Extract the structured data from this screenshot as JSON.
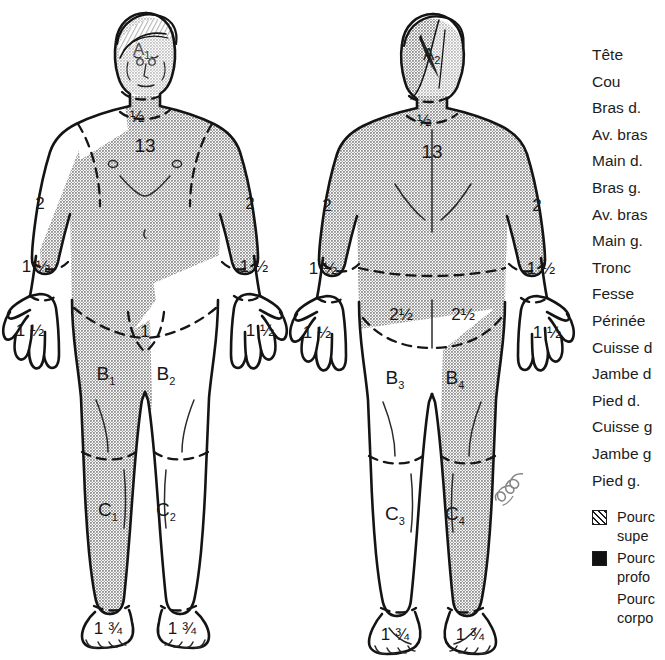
{
  "colors": {
    "ink": "#1a1a1a",
    "shade": "#ababab",
    "shade_dark": "#9a9a9a",
    "paper": "#ffffff"
  },
  "front_figure": {
    "name": "Anterior body diagram",
    "head_label": "A",
    "head_sub": "1",
    "neck": "½",
    "trunk": "13",
    "arm_left": "2",
    "arm_right": "2",
    "forearm_left": "1 ½",
    "forearm_right": "1 ½",
    "hand_left": "1 ½",
    "hand_right": "1 ½",
    "perineum": "1",
    "thigh_left": "B",
    "thigh_left_sub": "1",
    "thigh_right": "B",
    "thigh_right_sub": "2",
    "leg_left": "C",
    "leg_left_sub": "1",
    "leg_right": "C",
    "leg_right_sub": "2",
    "foot_left": "1 ¾",
    "foot_right": "1 ¾"
  },
  "back_figure": {
    "name": "Posterior body diagram",
    "head_label": "A",
    "head_sub": "2",
    "neck": "½",
    "trunk": "13",
    "arm_left": "2",
    "arm_right": "2",
    "forearm_left": "1 ½",
    "forearm_right": "1 ½",
    "hand_left": "1 ½",
    "hand_right": "1 ½",
    "buttock_left": "2½",
    "buttock_right": "2½",
    "thigh_left": "B",
    "thigh_left_sub": "3",
    "thigh_right": "B",
    "thigh_right_sub": "4",
    "leg_left": "C",
    "leg_left_sub": "3",
    "leg_right": "C",
    "leg_right_sub": "4",
    "foot_left": "1 ¾",
    "foot_right": "1 ¾"
  },
  "label_column": {
    "items": [
      "Tête",
      "Cou",
      "Bras d.",
      "Av. bras",
      "Main d.",
      "Bras g.",
      "Av. bras",
      "Main g.",
      "Tronc",
      "Fesse",
      "Périnée",
      "Cuisse d",
      "Jambe d",
      "Pied d.",
      "Cuisse g",
      "Jambe g",
      "Pied g."
    ]
  },
  "legend": {
    "entries": [
      {
        "icon": "hatched-square",
        "line1": "Pourc",
        "line2": "supe"
      },
      {
        "icon": "solid-square",
        "line1": "Pourc",
        "line2": "profo"
      },
      {
        "icon": "none",
        "line1": "Pourc",
        "line2": "corpo"
      }
    ]
  },
  "signature": {
    "text": "signature"
  }
}
